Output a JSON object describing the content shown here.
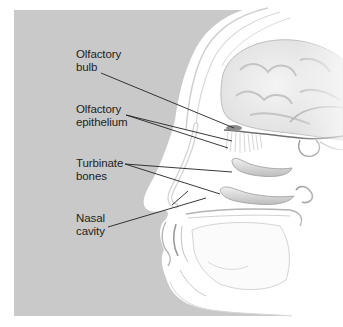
{
  "figure": {
    "background_panel_color": "#c9c9c9",
    "page_background": "#ffffff",
    "label_color": "#1e1e1e",
    "leader_line_color": "#222222"
  },
  "labels": [
    {
      "id": "olfactory-bulb",
      "line1": "Olfactory",
      "line2": "bulb",
      "x": 76,
      "y": 48
    },
    {
      "id": "olfactory-epithelium",
      "line1": "Olfactory",
      "line2": "epithelium",
      "x": 76,
      "y": 103
    },
    {
      "id": "turbinate-bones",
      "line1": "Turbinate",
      "line2": "bones",
      "x": 76,
      "y": 157
    },
    {
      "id": "nasal-cavity",
      "line1": "Nasal",
      "line2": "cavity",
      "x": 76,
      "y": 212
    }
  ],
  "leader_lines": {
    "olfactory_bulb": [
      [
        101,
        73,
        234,
        128
      ]
    ],
    "olfactory_epithelium": [
      [
        126,
        115,
        232,
        141
      ],
      [
        126,
        115,
        228,
        148
      ]
    ],
    "turbinate_bones": [
      [
        125,
        164,
        232,
        172
      ],
      [
        125,
        164,
        220,
        194
      ]
    ],
    "nasal_cavity": [
      [
        108,
        227,
        206,
        198
      ],
      [
        172,
        205,
        188,
        191
      ]
    ]
  }
}
